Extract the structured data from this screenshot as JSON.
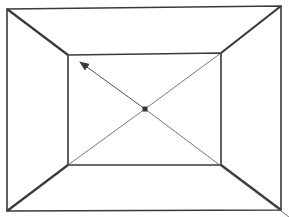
{
  "diagram": {
    "type": "one-point-perspective-room",
    "stroke_color": "#3a3a3a",
    "thin_stroke_color": "#555555",
    "background": "#ffffff",
    "outer_rect": {
      "tl": [
        7,
        9
      ],
      "tr": [
        281,
        6
      ],
      "br": [
        281,
        210
      ],
      "bl": [
        7,
        211
      ]
    },
    "inner_rect": {
      "tl": [
        68,
        55
      ],
      "tr": [
        221,
        53
      ],
      "br": [
        221,
        165
      ],
      "bl": [
        68,
        165
      ]
    },
    "vanishing_point": {
      "x": 145,
      "y": 109,
      "size": 5
    },
    "arrow": {
      "from": [
        145,
        109
      ],
      "to": [
        80,
        62
      ],
      "label": ""
    },
    "diagonal_extension_end": [
      289,
      217
    ]
  }
}
